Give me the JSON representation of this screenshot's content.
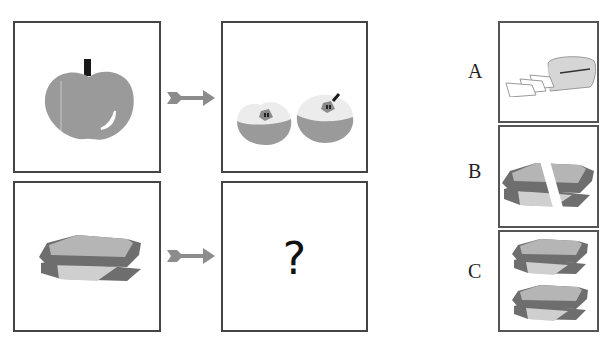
{
  "puzzle": {
    "type": "visual-analogy",
    "left_column": [
      {
        "row": 1,
        "item": "whole apple",
        "icon": "apple-icon"
      },
      {
        "row": 2,
        "item": "whole sandwich",
        "icon": "sandwich-icon"
      }
    ],
    "right_column": [
      {
        "row": 1,
        "item": "apple cut in halves",
        "icon": "apple-halves-icon"
      },
      {
        "row": 2,
        "item": "unknown",
        "symbol": "?"
      }
    ],
    "arrow_icon": "arrow-right-icon"
  },
  "options": [
    {
      "label": "A",
      "item": "sliced loaf of bread",
      "icon": "bread-loaf-icon"
    },
    {
      "label": "B",
      "item": "sandwich cut in half",
      "icon": "sandwich-cut-icon"
    },
    {
      "label": "C",
      "item": "two sandwiches",
      "icon": "two-sandwiches-icon"
    }
  ],
  "colors": {
    "border": "#444444",
    "fruit_gray": "#9a9a9a",
    "flesh_light": "#ececec",
    "stem": "#1a1a1a",
    "bread_top": "#b5b5b5",
    "crust": "#6e6e6e",
    "cheese": "#cfcfcf",
    "arrow": "#8c8c8c"
  }
}
